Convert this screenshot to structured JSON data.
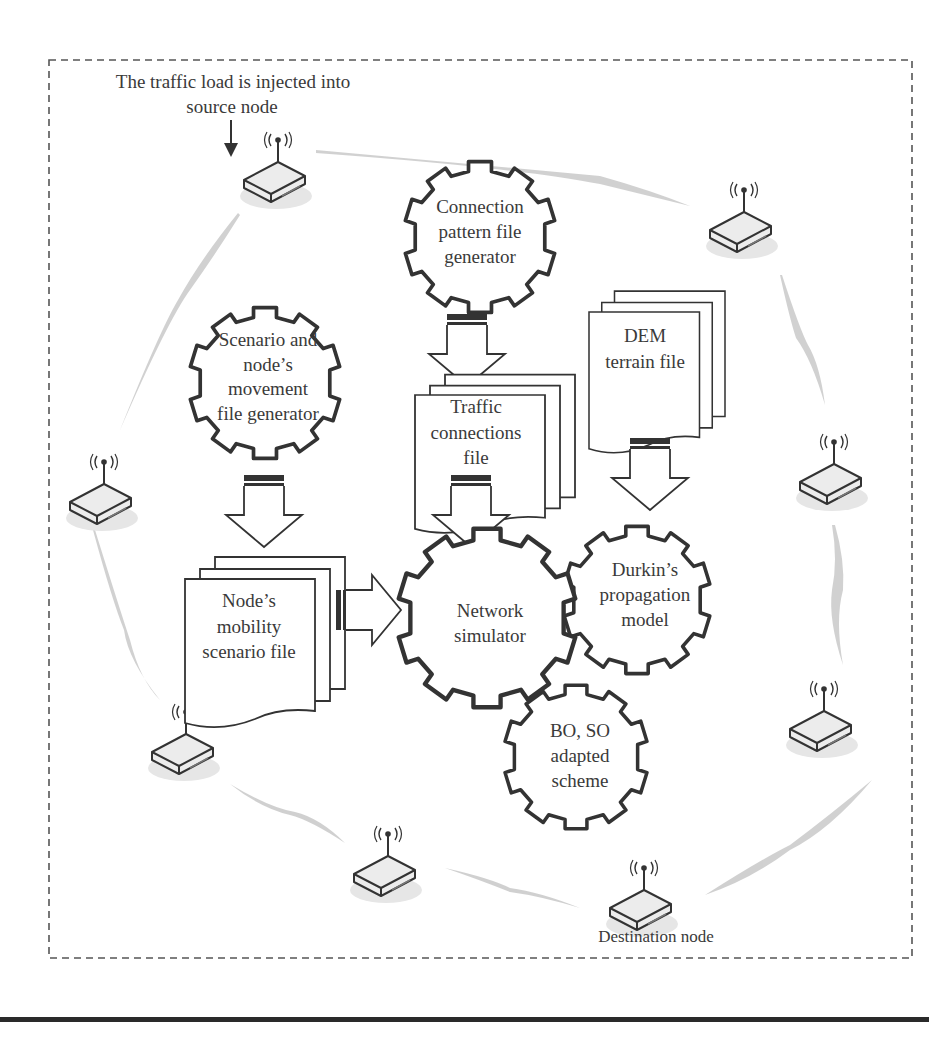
{
  "diagram": {
    "annotations": {
      "source_label_line1": "The traffic load is injected into",
      "source_label_line2": "source node",
      "destination_label": "Destination node"
    },
    "gears": [
      {
        "id": "connection-pattern",
        "lines": [
          "Connection",
          "pattern file",
          "generator"
        ]
      },
      {
        "id": "scenario-movement",
        "lines": [
          "Scenario and",
          "node’s",
          "movement",
          "file generator"
        ]
      },
      {
        "id": "network-simulator",
        "lines": [
          "Network",
          "simulator"
        ]
      },
      {
        "id": "durkin-propagation",
        "lines": [
          "Durkin’s",
          "propagation",
          "model"
        ]
      },
      {
        "id": "bo-so-scheme",
        "lines": [
          "BO, SO",
          "adapted",
          "scheme"
        ]
      }
    ],
    "files": [
      {
        "id": "traffic-connections",
        "lines": [
          "Traffic",
          "connections",
          "file"
        ]
      },
      {
        "id": "dem-terrain",
        "lines": [
          "DEM",
          "terrain file"
        ]
      },
      {
        "id": "node-mobility",
        "lines": [
          "Node’s",
          "mobility",
          "scenario file"
        ]
      }
    ],
    "nodes": [
      {
        "id": "source",
        "role": "source node"
      },
      {
        "id": "top-right"
      },
      {
        "id": "left"
      },
      {
        "id": "right"
      },
      {
        "id": "bottom-left"
      },
      {
        "id": "bottom-right"
      },
      {
        "id": "bottom-middle"
      },
      {
        "id": "destination",
        "role": "destination node"
      }
    ],
    "colors": {
      "stroke": "#333333",
      "link": "#c8c8c8",
      "border_dash": "#555555",
      "rule": "#2a2a2a"
    }
  }
}
